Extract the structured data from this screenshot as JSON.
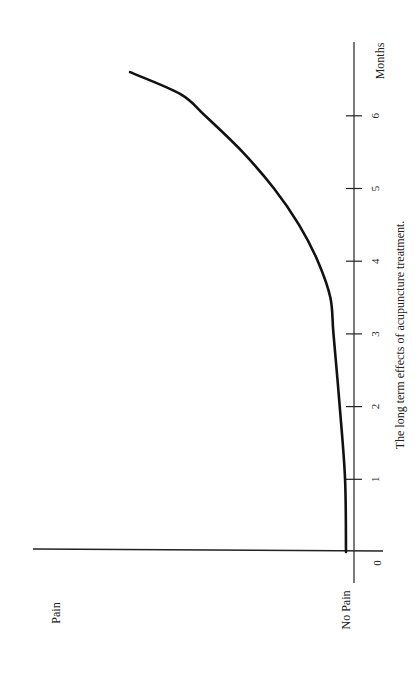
{
  "chart_data": {
    "type": "line",
    "orientation": "rotated-90-ccw",
    "title": "The long term effects of acupuncture treatment.",
    "xlabel": "Months",
    "ylabel": "",
    "y_axis_labels": {
      "low": "No Pain",
      "high": "Pain"
    },
    "x_ticks": [
      "0",
      "1",
      "2",
      "3",
      "4",
      "5",
      "6"
    ],
    "xlim": [
      0,
      6.7
    ],
    "ylim": [
      0,
      100
    ],
    "grid": false,
    "legend": null,
    "series": [
      {
        "name": "Pain level",
        "x": [
          0,
          1,
          2,
          3,
          3.5,
          4,
          4.5,
          5,
          5.5,
          6,
          6.3,
          6.6
        ],
        "values": [
          0,
          0.3,
          2,
          4,
          5,
          9,
          15,
          23,
          33,
          45,
          53,
          69
        ]
      }
    ]
  }
}
